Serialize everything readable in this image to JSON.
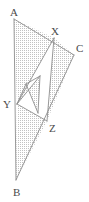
{
  "figure": {
    "background_color": "#ffffff",
    "stroke_color": "#8d8d8d",
    "label_color": "#4a4a4a",
    "stipple_dot_color": "#bcbcbc",
    "stipple_spacing_px": 2,
    "labels": [
      {
        "id": "A",
        "text": "A",
        "x": 10,
        "y": 16
      },
      {
        "id": "X",
        "text": "X",
        "x": 51,
        "y": 35
      },
      {
        "id": "C",
        "text": "C",
        "x": 76,
        "y": 52
      },
      {
        "id": "Y",
        "text": "Y",
        "x": 3,
        "y": 108
      },
      {
        "id": "Z",
        "text": "Z",
        "x": 49,
        "y": 132
      },
      {
        "id": "B",
        "text": "B",
        "x": 13,
        "y": 196
      }
    ],
    "points": {
      "A": {
        "x": 14,
        "y": 19
      },
      "B": {
        "x": 16,
        "y": 180
      },
      "C": {
        "x": 74,
        "y": 55
      },
      "X": {
        "x": 54,
        "y": 38
      },
      "Y": {
        "x": 17,
        "y": 104
      },
      "Z": {
        "x": 47,
        "y": 121
      },
      "P": {
        "x": 26,
        "y": 84
      },
      "Q": {
        "x": 40,
        "y": 76
      },
      "R": {
        "x": 38,
        "y": 113
      }
    },
    "segments": [
      {
        "name": "A-B",
        "from": "A",
        "to": "B"
      },
      {
        "name": "A-C",
        "from": "A",
        "to": "C"
      },
      {
        "name": "B-C",
        "from": "B",
        "to": "C"
      },
      {
        "name": "X-Y",
        "from": "X",
        "to": "Y"
      },
      {
        "name": "X-Z",
        "from": "X",
        "to": "Z"
      },
      {
        "name": "Y-Z",
        "from": "Y",
        "to": "Z"
      },
      {
        "name": "Y-Q",
        "from": "Y",
        "to": "Q"
      },
      {
        "name": "P-Q",
        "from": "P",
        "to": "Q"
      },
      {
        "name": "P-R",
        "from": "P",
        "to": "R"
      },
      {
        "name": "Q-R",
        "from": "Q",
        "to": "R"
      },
      {
        "name": "P-Y",
        "from": "P",
        "to": "Y"
      }
    ],
    "shaded_regions": [
      {
        "name": "triangle-A-X-Y",
        "vertices": [
          "A",
          "X",
          "Y"
        ]
      },
      {
        "name": "triangle-X-C-Z",
        "vertices": [
          "X",
          "C",
          "Z"
        ]
      },
      {
        "name": "triangle-Y-Z-B",
        "vertices": [
          "Y",
          "Z",
          "B"
        ]
      },
      {
        "name": "parallelogram-core",
        "vertices": [
          "Y",
          "Q",
          "R",
          "P"
        ]
      }
    ]
  }
}
